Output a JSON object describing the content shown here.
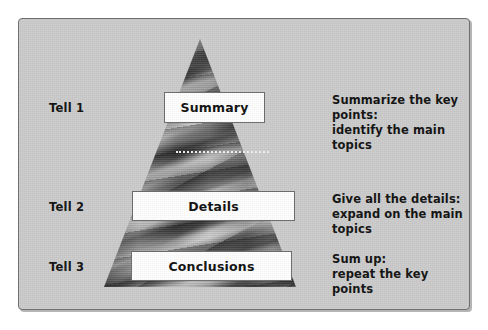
{
  "figure": {
    "background_color": "#ffffff",
    "panel_background_color": "#cccccc",
    "panel_border_color": "#6f6f6f",
    "text_color": "#111111",
    "box_fill_color": "#ffffff",
    "box_border_color": "#6d6d6d",
    "divider_color": "#f2f2f2"
  },
  "pyramid": {
    "name": "three-tell-pyramid",
    "divider_style": "dotted"
  },
  "levels": [
    {
      "tell_label": "Tell 1",
      "box_label": "Summary",
      "note": "Summarize the key points:\nidentify the main topics"
    },
    {
      "tell_label": "Tell 2",
      "box_label": "Details",
      "note": "Give all the details:\nexpand on the main topics"
    },
    {
      "tell_label": "Tell 3",
      "box_label": "Conclusions",
      "note": "Sum up:\nrepeat the key points"
    }
  ]
}
